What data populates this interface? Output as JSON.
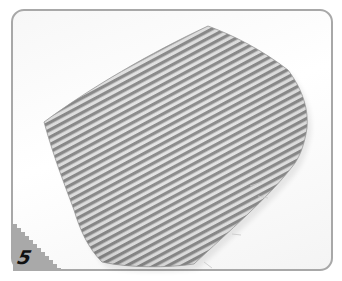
{
  "image": {
    "description": "Instructional craft step photo: striped fabric piece on white background",
    "step_badge": {
      "number": "5",
      "badge_color": "#a9a9a9",
      "text_color": "#111111"
    },
    "frame": {
      "border_color": "#a8a8a8",
      "background": "#ffffff"
    },
    "fabric": {
      "pattern": "diagonal-stripes",
      "stripe_dark": "#8a8a8a",
      "stripe_light": "#e2e2e2",
      "stripe_angle_deg": -28
    }
  }
}
